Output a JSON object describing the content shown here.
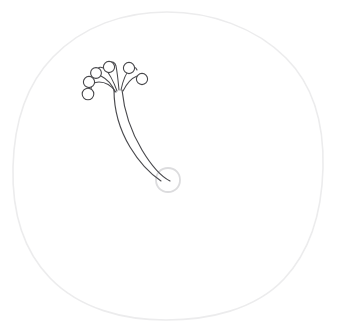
{
  "artwork": {
    "title": "Stamen Line Drawing",
    "subject": "flower-stamen-sketch",
    "style": "minimal-line-drawing",
    "canvas": {
      "width": 338,
      "height": 335,
      "background_color": "#ffffff"
    },
    "enclosing_circle": {
      "name": "hand-drawn-circle-outline",
      "stroke_color": "#ececed",
      "stroke_width": 1.6,
      "center_x": 167,
      "center_y": 166,
      "radius_x": 155,
      "radius_y": 153,
      "path": "M 167 12 C 210 12 255 27 286 58 C 317 89 324 130 323 168 C 322 206 313 248 284 279 C 255 310 208 320 166 320 C 124 320 80 309 50 278 C 20 247 12 205 13 167 C 14 129 23 88 53 57 C 83 26 124 12 167 12 Z"
    },
    "base_bulb": {
      "name": "ovary-bulb",
      "stroke_color": "#dcdcde",
      "fill_color": "#ffffff",
      "center_x": 168,
      "center_y": 180,
      "radius": 12,
      "path": "M 168 168 C 175 168 180 173 180 180 C 180 187 175 192 168 192 C 161 192 156 187 156 180 C 156 173 161 168 168 168 Z"
    },
    "stems": [
      {
        "name": "stem-left",
        "stroke_color": "#4a4a4e",
        "path": "M 114 90 C 114 108 118 127 130 147 C 142 167 155 177 161 181"
      },
      {
        "name": "stem-right",
        "stroke_color": "#4a4a4e",
        "path": "M 122 90 C 124 110 130 130 142 150 C 154 170 164 178 170 181"
      }
    ],
    "filaments": [
      {
        "name": "filament-1",
        "path": "M 115 92 C 112 84 107 79 101 76 C 96 73 93 74 92 77"
      },
      {
        "name": "filament-2",
        "path": "M 116 92 C 111 85 105 82 99 82 C 94 82 91 85 91 89"
      },
      {
        "name": "filament-3",
        "path": "M 117 91 C 113 80 109 73 105 69 C 101 66 98 67 97 70"
      },
      {
        "name": "filament-4",
        "path": "M 119 90 C 118 79 117 71 116 66 C 115 62 112 61 110 63"
      },
      {
        "name": "filament-5",
        "path": "M 121 90 C 123 80 126 73 130 69 C 133 66 136 67 137 70"
      },
      {
        "name": "filament-6",
        "path": "M 123 91 C 127 83 132 78 137 76 C 141 74 144 76 144 79"
      }
    ],
    "anthers": [
      {
        "name": "anther-1",
        "cx": 89,
        "cy": 82,
        "r": 5.6
      },
      {
        "name": "anther-2",
        "cx": 88,
        "cy": 94,
        "r": 5.8
      },
      {
        "name": "anther-3",
        "cx": 96,
        "cy": 73,
        "r": 5.4
      },
      {
        "name": "anther-4",
        "cx": 109,
        "cy": 67,
        "r": 5.6
      },
      {
        "name": "anther-5",
        "cx": 129,
        "cy": 68,
        "r": 5.6
      },
      {
        "name": "anther-6",
        "cx": 142,
        "cy": 79,
        "r": 5.6
      }
    ],
    "colors": {
      "background": "#ffffff",
      "circle_stroke": "#ececed",
      "stem_stroke": "#4a4a4e",
      "filament_stroke": "#47474b",
      "anther_fill": "#ffffff",
      "bulb_stroke": "#dcdcde"
    }
  }
}
